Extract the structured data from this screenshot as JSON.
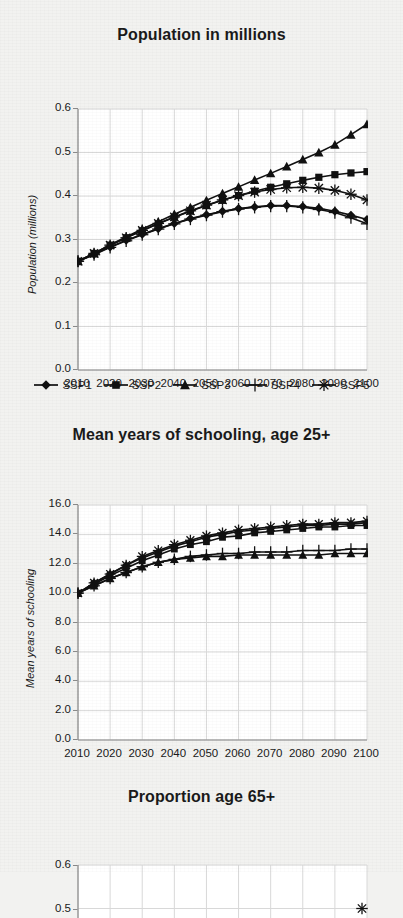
{
  "page": {
    "background_color": "#f2f2f0",
    "ink_color": "#111111",
    "grid_color": "#d8d8d8",
    "plot_background": "#ffffff"
  },
  "series_names": [
    "SSP1",
    "SSP2",
    "SSP3",
    "SSP4",
    "SSP5"
  ],
  "legend": {
    "items": [
      {
        "label": "SSP1",
        "marker": "diamond-marker"
      },
      {
        "label": "SSP2",
        "marker": "square-marker"
      },
      {
        "label": "SSP3",
        "marker": "triangle-marker"
      },
      {
        "label": "SSP4",
        "marker": "plus-marker"
      },
      {
        "label": "SSP5",
        "marker": "asterisk-marker"
      }
    ]
  },
  "chart_data": [
    {
      "id": "population",
      "type": "line",
      "title": "Population in millions",
      "xlabel": "",
      "ylabel": "Population (millions)",
      "xlim": [
        2010,
        2100
      ],
      "ylim": [
        0.0,
        0.6
      ],
      "grid": true,
      "legend_position": "bottom",
      "x": [
        2010,
        2015,
        2020,
        2025,
        2030,
        2035,
        2040,
        2045,
        2050,
        2055,
        2060,
        2065,
        2070,
        2075,
        2080,
        2085,
        2090,
        2095,
        2100
      ],
      "xticklabels": [
        "2010",
        "2020",
        "2030",
        "2040",
        "2050",
        "2060",
        "2070",
        "2080",
        "2090",
        "2100"
      ],
      "yticklabels": [
        "0.0",
        "0.1",
        "0.2",
        "0.3",
        "0.4",
        "0.5",
        "0.6"
      ],
      "series": [
        {
          "name": "SSP1",
          "marker": "diamond-marker",
          "values": [
            0.25,
            0.266,
            0.283,
            0.298,
            0.312,
            0.325,
            0.337,
            0.348,
            0.357,
            0.365,
            0.371,
            0.375,
            0.378,
            0.378,
            0.376,
            0.372,
            0.365,
            0.356,
            0.346
          ]
        },
        {
          "name": "SSP2",
          "marker": "square-marker",
          "values": [
            0.25,
            0.268,
            0.287,
            0.304,
            0.32,
            0.336,
            0.351,
            0.365,
            0.378,
            0.39,
            0.401,
            0.411,
            0.42,
            0.428,
            0.436,
            0.443,
            0.449,
            0.453,
            0.456
          ]
        },
        {
          "name": "SSP3",
          "marker": "triangle-marker",
          "values": [
            0.25,
            0.268,
            0.288,
            0.306,
            0.324,
            0.341,
            0.358,
            0.374,
            0.39,
            0.406,
            0.421,
            0.437,
            0.452,
            0.468,
            0.484,
            0.5,
            0.518,
            0.541,
            0.565
          ]
        },
        {
          "name": "SSP4",
          "marker": "plus-marker",
          "values": [
            0.25,
            0.265,
            0.282,
            0.297,
            0.311,
            0.324,
            0.336,
            0.347,
            0.356,
            0.364,
            0.37,
            0.374,
            0.377,
            0.377,
            0.374,
            0.369,
            0.362,
            0.35,
            0.336
          ]
        },
        {
          "name": "SSP5",
          "marker": "asterisk-marker",
          "values": [
            0.25,
            0.268,
            0.287,
            0.304,
            0.321,
            0.337,
            0.352,
            0.366,
            0.379,
            0.391,
            0.401,
            0.409,
            0.415,
            0.419,
            0.42,
            0.418,
            0.413,
            0.404,
            0.391
          ]
        }
      ]
    },
    {
      "id": "schooling",
      "type": "line",
      "title": "Mean years of schooling, age 25+",
      "xlabel": "",
      "ylabel": "Mean years of schooling",
      "xlim": [
        2010,
        2100
      ],
      "ylim": [
        0.0,
        16.0
      ],
      "grid": true,
      "legend_position": "none",
      "x": [
        2010,
        2015,
        2020,
        2025,
        2030,
        2035,
        2040,
        2045,
        2050,
        2055,
        2060,
        2065,
        2070,
        2075,
        2080,
        2085,
        2090,
        2095,
        2100
      ],
      "xticklabels": [
        "2010",
        "2020",
        "2030",
        "2040",
        "2050",
        "2060",
        "2070",
        "2080",
        "2090",
        "2100"
      ],
      "yticklabels": [
        "0.0",
        "2.0",
        "4.0",
        "6.0",
        "8.0",
        "10.0",
        "12.0",
        "14.0",
        "16.0"
      ],
      "series": [
        {
          "name": "SSP1",
          "marker": "diamond-marker",
          "values": [
            10.0,
            10.7,
            11.3,
            11.9,
            12.4,
            12.8,
            13.2,
            13.5,
            13.8,
            14.0,
            14.2,
            14.3,
            14.4,
            14.5,
            14.6,
            14.6,
            14.7,
            14.7,
            14.8
          ]
        },
        {
          "name": "SSP2",
          "marker": "square-marker",
          "values": [
            10.0,
            10.6,
            11.2,
            11.7,
            12.2,
            12.6,
            13.0,
            13.3,
            13.5,
            13.8,
            13.9,
            14.1,
            14.2,
            14.3,
            14.4,
            14.5,
            14.5,
            14.6,
            14.6
          ]
        },
        {
          "name": "SSP3",
          "marker": "triangle-marker",
          "values": [
            10.0,
            10.5,
            11.0,
            11.4,
            11.8,
            12.1,
            12.3,
            12.4,
            12.5,
            12.5,
            12.6,
            12.6,
            12.6,
            12.6,
            12.6,
            12.6,
            12.7,
            12.7,
            12.7
          ]
        },
        {
          "name": "SSP4",
          "marker": "plus-marker",
          "values": [
            10.0,
            10.5,
            11.0,
            11.4,
            11.8,
            12.1,
            12.3,
            12.5,
            12.6,
            12.7,
            12.7,
            12.8,
            12.8,
            12.8,
            12.9,
            12.9,
            12.9,
            13.0,
            13.0
          ]
        },
        {
          "name": "SSP5",
          "marker": "asterisk-marker",
          "values": [
            10.0,
            10.7,
            11.3,
            11.9,
            12.5,
            12.9,
            13.3,
            13.6,
            13.9,
            14.1,
            14.3,
            14.4,
            14.5,
            14.6,
            14.7,
            14.7,
            14.8,
            14.8,
            14.9
          ]
        }
      ]
    },
    {
      "id": "prop65",
      "type": "line",
      "title": "Proportion age 65+",
      "xlabel": "",
      "ylabel": "",
      "xlim": [
        2010,
        2100
      ],
      "ylim": [
        0.0,
        0.6
      ],
      "grid": true,
      "legend_position": "none",
      "cropped": true,
      "x": [
        2100
      ],
      "xticklabels": [],
      "yticklabels": [
        "0.6",
        "0.5"
      ],
      "series": [
        {
          "name": "SSP5",
          "marker": "asterisk-marker",
          "values": [
            0.5
          ]
        }
      ]
    }
  ]
}
